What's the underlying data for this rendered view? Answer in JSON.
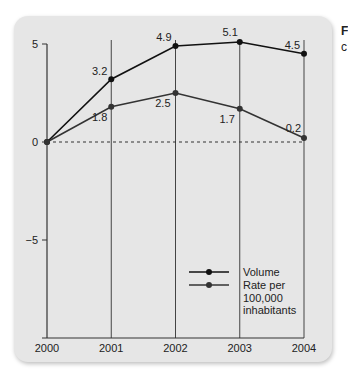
{
  "corner_text": {
    "line1": "F",
    "line2": "c"
  },
  "chart_data": {
    "type": "line",
    "title": "",
    "xlabel": "",
    "ylabel": "",
    "x": [
      "2000",
      "2001",
      "2002",
      "2003",
      "2004"
    ],
    "ylim": [
      -10,
      5
    ],
    "yticks": [
      5,
      0,
      -5
    ],
    "ytick_labels": [
      "5",
      "0",
      "−5"
    ],
    "reference_line": {
      "y": 0,
      "style": "dashed"
    },
    "grid": "vertical lines at each year",
    "series": [
      {
        "name": "Volume",
        "values": [
          0,
          3.2,
          4.9,
          5.1,
          4.5
        ],
        "labels": [
          "",
          "3.2",
          "4.9",
          "5.1",
          "4.5"
        ],
        "color": "#111111"
      },
      {
        "name": "Rate per 100,000 inhabitants",
        "values": [
          0,
          1.8,
          2.5,
          1.7,
          0.2
        ],
        "labels": [
          "",
          "1.8",
          "2.5",
          "1.7",
          "0.2"
        ],
        "color": "#333333"
      }
    ],
    "legend": {
      "placement": "bottom-right",
      "entries": [
        {
          "lines": [
            "Volume"
          ]
        },
        {
          "lines": [
            "Rate per",
            "100,000",
            "inhabitants"
          ]
        }
      ]
    }
  }
}
